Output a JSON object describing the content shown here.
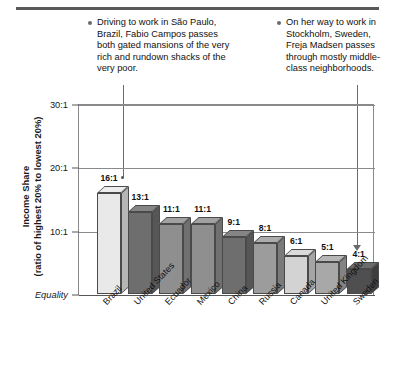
{
  "callouts": [
    {
      "id": "brazil",
      "icon": "bullet-dot",
      "text": "Driving to work in São Paulo, Brazil, Fabio Campos passes both gated mansions of the very rich and rundown shacks of the very poor."
    },
    {
      "id": "sweden",
      "icon": "bullet-dot",
      "text": "On her way to work in Stockholm, Sweden, Freja Madsen passes through mostly middle-class neighborhoods."
    }
  ],
  "chart_data": {
    "type": "bar",
    "title": "",
    "xlabel": "",
    "ylabel": "Income Share",
    "ylabel_sub": "(ratio of highest 20% to lowest 20%)",
    "categories": [
      "Brazil",
      "United States",
      "Ecuador",
      "Mexico",
      "China",
      "Russia",
      "Canada",
      "United Kingdom",
      "Sweden"
    ],
    "values": [
      16,
      13,
      11,
      11,
      9,
      8,
      6,
      5,
      4
    ],
    "value_labels": [
      "16:1",
      "13:1",
      "11:1",
      "11:1",
      "9:1",
      "8:1",
      "6:1",
      "5:1",
      "4:1"
    ],
    "bar_colors": [
      "#e9e9e9",
      "#6e6e6e",
      "#8f8f8f",
      "#8f8f8f",
      "#6e6e6e",
      "#9c9c9c",
      "#d3d3d3",
      "#a8a8a8",
      "#4f4f4f"
    ],
    "ytick_labels": [
      "30:1",
      "20:1",
      "10:1",
      "Equality"
    ],
    "ytick_values": [
      30,
      20,
      10,
      0
    ],
    "ylim": [
      0,
      30
    ],
    "grid": true,
    "legend": "none"
  },
  "axis": {
    "title_line1": "Income Share",
    "title_line2": "(ratio of highest 20% to lowest 20%)"
  }
}
